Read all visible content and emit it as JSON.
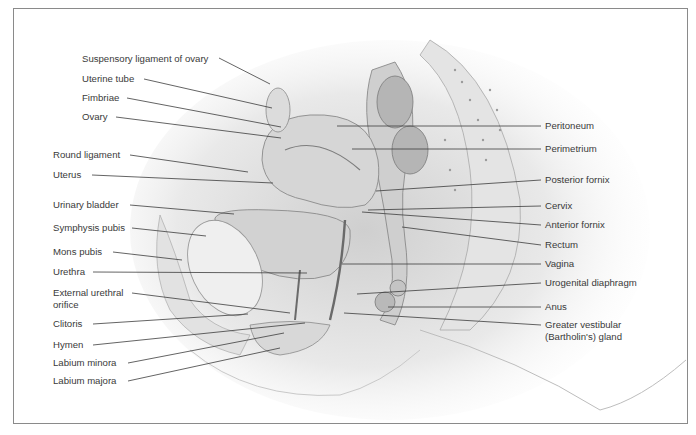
{
  "figure": {
    "left_labels": [
      {
        "text": "Suspensory ligament of ovary",
        "x": 82,
        "y": 53,
        "tx": 270,
        "ty": 84,
        "lx": 219,
        "ly": 58
      },
      {
        "text": "Uterine tube",
        "x": 82,
        "y": 73,
        "tx": 272,
        "ty": 108,
        "lx": 144,
        "ly": 79
      },
      {
        "text": "Fimbriae",
        "x": 82,
        "y": 92,
        "tx": 281,
        "ty": 127,
        "lx": 127,
        "ly": 98
      },
      {
        "text": "Ovary",
        "x": 82,
        "y": 111,
        "tx": 281,
        "ty": 138,
        "lx": 116,
        "ly": 117
      },
      {
        "text": "Round ligament",
        "x": 53,
        "y": 149,
        "tx": 248,
        "ty": 172,
        "lx": 130,
        "ly": 155
      },
      {
        "text": "Uterus",
        "x": 53,
        "y": 169,
        "tx": 273,
        "ty": 183,
        "lx": 92,
        "ly": 175
      },
      {
        "text": "Urinary bladder",
        "x": 53,
        "y": 199,
        "tx": 234,
        "ty": 214,
        "lx": 130,
        "ly": 205
      },
      {
        "text": "Symphysis pubis",
        "x": 53,
        "y": 222,
        "tx": 206,
        "ty": 236,
        "lx": 132,
        "ly": 228
      },
      {
        "text": "Mons pubis",
        "x": 53,
        "y": 246,
        "tx": 182,
        "ty": 260,
        "lx": 113,
        "ly": 252
      },
      {
        "text": "Urethra",
        "x": 53,
        "y": 266,
        "tx": 307,
        "ty": 273,
        "lx": 93,
        "ly": 272
      },
      {
        "text": "External urethral\norifice",
        "x": 53,
        "y": 287,
        "tx": 290,
        "ty": 313,
        "lx": 132,
        "ly": 293
      },
      {
        "text": "Clitoris",
        "x": 53,
        "y": 318,
        "tx": 248,
        "ty": 314,
        "lx": 93,
        "ly": 324
      },
      {
        "text": "Hymen",
        "x": 53,
        "y": 339,
        "tx": 305,
        "ty": 323,
        "lx": 93,
        "ly": 345
      },
      {
        "text": "Labium minora",
        "x": 53,
        "y": 357,
        "tx": 284,
        "ty": 333,
        "lx": 128,
        "ly": 363
      },
      {
        "text": "Labium majora",
        "x": 53,
        "y": 375,
        "tx": 280,
        "ty": 348,
        "lx": 128,
        "ly": 381
      }
    ],
    "right_labels": [
      {
        "text": "Peritoneum",
        "x": 545,
        "y": 120,
        "tx": 337,
        "ty": 126,
        "lx": 541,
        "ly": 126
      },
      {
        "text": "Perimetrium",
        "x": 545,
        "y": 143,
        "tx": 352,
        "ty": 149,
        "lx": 541,
        "ly": 149
      },
      {
        "text": "Posterior fornix",
        "x": 545,
        "y": 174,
        "tx": 376,
        "ty": 191,
        "lx": 541,
        "ly": 180
      },
      {
        "text": "Cervix",
        "x": 545,
        "y": 200,
        "tx": 368,
        "ty": 210,
        "lx": 541,
        "ly": 206
      },
      {
        "text": "Anterior fornix",
        "x": 545,
        "y": 219,
        "tx": 362,
        "ty": 212,
        "lx": 541,
        "ly": 225
      },
      {
        "text": "Rectum",
        "x": 545,
        "y": 239,
        "tx": 402,
        "ty": 227,
        "lx": 541,
        "ly": 245
      },
      {
        "text": "Vagina",
        "x": 545,
        "y": 258,
        "tx": 342,
        "ty": 264,
        "lx": 541,
        "ly": 264
      },
      {
        "text": "Urogenital diaphragm",
        "x": 545,
        "y": 277,
        "tx": 357,
        "ty": 294,
        "lx": 541,
        "ly": 283
      },
      {
        "text": "Anus",
        "x": 545,
        "y": 301,
        "tx": 388,
        "ty": 307,
        "lx": 541,
        "ly": 307
      },
      {
        "text": "Greater vestibular\n(Bartholin's) gland",
        "x": 545,
        "y": 319,
        "tx": 344,
        "ty": 313,
        "lx": 541,
        "ly": 325
      }
    ]
  },
  "colors": {
    "frame": "#8a8a8a",
    "text": "#3a3a3a",
    "leader": "#3c3c3c",
    "tissue_light": "#e6e6e6",
    "tissue_mid": "#c4c4c4",
    "tissue_dark": "#8d8d8d"
  }
}
